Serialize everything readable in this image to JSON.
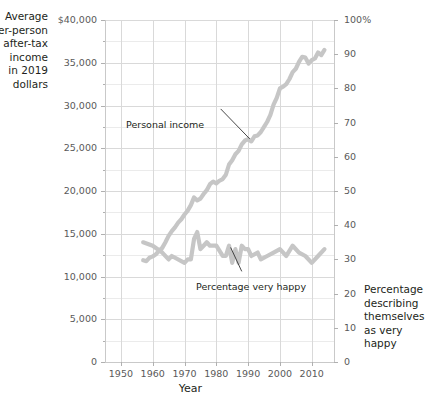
{
  "axis_titles": {
    "left": "Average\nper-person\nafter-tax income\nin 2019 dollars",
    "right": "Percentage\ndescribing\nthemselves\nas very happy",
    "bottom": "Year"
  },
  "annotations": {
    "income": "Personal income",
    "happy": "Percentage very happy"
  },
  "chart_data": {
    "type": "line",
    "title": "",
    "xlabel": "Year",
    "ylabel": "Average per-person after-tax income in 2019 dollars",
    "y2label": "Percentage describing themselves as very happy",
    "xlim": [
      1945,
      2017
    ],
    "ylim": [
      0,
      40000
    ],
    "y2lim": [
      0,
      100
    ],
    "grid": true,
    "legend": "annotations-inline",
    "x_ticks": [
      1950,
      1960,
      1970,
      1980,
      1990,
      2000,
      2010
    ],
    "x_tick_labels": [
      "1950",
      "1960",
      "1970",
      "1980",
      "1990",
      "2000",
      "2010"
    ],
    "y_ticks": [
      0,
      5000,
      10000,
      15000,
      20000,
      25000,
      30000,
      35000,
      40000
    ],
    "y_tick_labels": [
      "0",
      "5,000",
      "10,000",
      "15,000",
      "20,000",
      "25,000",
      "30,000",
      "35,000",
      "$40,000"
    ],
    "y_minor_ticks": [
      2500,
      7500,
      12500,
      17500,
      22500,
      27500,
      32500,
      37500
    ],
    "y2_ticks": [
      0,
      10,
      20,
      30,
      40,
      50,
      60,
      70,
      80,
      90,
      100
    ],
    "y2_tick_labels": [
      "0",
      "10",
      "20",
      "30",
      "40",
      "50",
      "60",
      "70",
      "80",
      "90",
      "100%"
    ],
    "series": [
      {
        "name": "Personal income",
        "axis": "left",
        "color": "#c6c6c6",
        "x": [
          1957,
          1958,
          1959,
          1960,
          1961,
          1962,
          1963,
          1964,
          1965,
          1966,
          1967,
          1968,
          1969,
          1970,
          1971,
          1972,
          1973,
          1974,
          1975,
          1976,
          1977,
          1978,
          1979,
          1980,
          1981,
          1982,
          1983,
          1984,
          1985,
          1986,
          1987,
          1988,
          1989,
          1990,
          1991,
          1992,
          1993,
          1994,
          1995,
          1996,
          1997,
          1998,
          1999,
          2000,
          2001,
          2002,
          2003,
          2004,
          2005,
          2006,
          2007,
          2008,
          2009,
          2010,
          2011,
          2012,
          2013,
          2014
        ],
        "values": [
          11900,
          11800,
          12200,
          12350,
          12600,
          13000,
          13350,
          14000,
          14750,
          15300,
          15750,
          16300,
          16700,
          17250,
          17700,
          18350,
          19250,
          18900,
          19100,
          19650,
          20100,
          20800,
          21100,
          20900,
          21200,
          21400,
          21900,
          23100,
          23600,
          24300,
          24700,
          25450,
          25900,
          26050,
          25800,
          26400,
          26500,
          26900,
          27500,
          28100,
          28900,
          30100,
          30900,
          32000,
          32200,
          32500,
          33100,
          33900,
          34300,
          35100,
          35700,
          35600,
          34900,
          35300,
          35500,
          36200,
          35900,
          36500
        ]
      },
      {
        "name": "Percentage very happy",
        "axis": "right",
        "color": "#c6c6c6",
        "x": [
          1957,
          1960,
          1963,
          1965,
          1966,
          1970,
          1971,
          1972,
          1973,
          1974,
          1975,
          1976,
          1977,
          1978,
          1980,
          1982,
          1983,
          1984,
          1985,
          1986,
          1987,
          1988,
          1989,
          1990,
          1991,
          1993,
          1994,
          1996,
          1998,
          2000,
          2002,
          2004,
          2006,
          2008,
          2010,
          2012,
          2014
        ],
        "values": [
          35,
          34,
          32,
          30,
          31,
          29,
          30,
          30,
          36,
          38,
          33,
          34,
          35,
          34,
          34,
          31,
          31,
          34,
          29,
          33,
          29,
          34,
          33,
          33,
          31,
          32,
          30,
          31,
          32,
          33,
          31,
          34,
          32,
          31,
          29,
          31,
          33
        ]
      }
    ]
  }
}
